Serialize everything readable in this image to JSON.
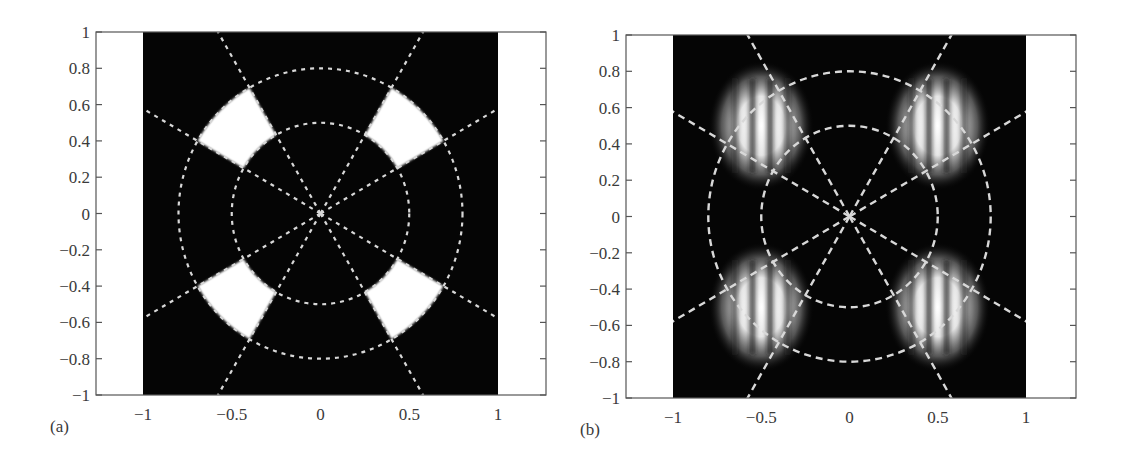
{
  "figure": {
    "panels": [
      {
        "id": "a",
        "label": "(a)"
      },
      {
        "id": "b",
        "label": "(b)"
      }
    ]
  },
  "colors": {
    "background": "#ffffff",
    "plot_field": "#050505",
    "aperture": "#ffffff",
    "overlay_dash": "#d8d8d8",
    "axis": "#555555"
  },
  "chart_data": [
    {
      "type": "heatmap",
      "panel": "(a)",
      "title": "",
      "xlabel": "",
      "ylabel": "",
      "xlim": [
        -1.3,
        1.3
      ],
      "ylim": [
        -1,
        1
      ],
      "image_extent": {
        "x": [
          -1,
          1
        ],
        "y": [
          -1,
          1
        ]
      },
      "x_ticks": [
        -1,
        -0.5,
        0,
        0.5,
        1
      ],
      "x_tick_labels": [
        "−1",
        "−0.5",
        "0",
        "0.5",
        "1"
      ],
      "y_ticks": [
        1,
        0.8,
        0.6,
        0.4,
        0.2,
        0,
        -0.2,
        -0.4,
        -0.6,
        -0.8,
        -1
      ],
      "y_tick_labels": [
        "1",
        "0.8",
        "0.6",
        "0.4",
        "0.2",
        "0",
        "−0.2",
        "−0.4",
        "−0.6",
        "−0.8",
        "−1"
      ],
      "grid": false,
      "description": "Binary aperture mask: four white annular sectors on black",
      "apertures": [
        {
          "r_inner": 0.5,
          "r_outer": 0.8,
          "theta_deg": [
            30,
            60
          ]
        },
        {
          "r_inner": 0.5,
          "r_outer": 0.8,
          "theta_deg": [
            120,
            150
          ]
        },
        {
          "r_inner": 0.5,
          "r_outer": 0.8,
          "theta_deg": [
            210,
            240
          ]
        },
        {
          "r_inner": 0.5,
          "r_outer": 0.8,
          "theta_deg": [
            300,
            330
          ]
        }
      ],
      "overlay": {
        "circles_r": [
          0.5,
          0.8
        ],
        "rays_deg": [
          30,
          60,
          120,
          150,
          210,
          240,
          300,
          330
        ],
        "style": "dashed white"
      }
    },
    {
      "type": "heatmap",
      "panel": "(b)",
      "title": "",
      "xlabel": "",
      "ylabel": "",
      "xlim": [
        -1.3,
        1.3
      ],
      "ylim": [
        -1,
        1
      ],
      "image_extent": {
        "x": [
          -1,
          1
        ],
        "y": [
          -1,
          1
        ]
      },
      "x_ticks": [
        -1,
        -0.5,
        0,
        0.5,
        1
      ],
      "x_tick_labels": [
        "−1",
        "−0.5",
        "0",
        "0.5",
        "1"
      ],
      "y_ticks": [
        1,
        0.8,
        0.6,
        0.4,
        0.2,
        0,
        -0.2,
        -0.4,
        -0.6,
        -0.8,
        -1
      ],
      "y_tick_labels": [
        "1",
        "0.8",
        "0.6",
        "0.4",
        "0.2",
        "0",
        "−0.2",
        "−0.4",
        "−0.6",
        "−0.8",
        "−1"
      ],
      "grid": false,
      "description": "Intensity pattern: four blurred bright lobes with vertical interference fringes at the aperture positions",
      "lobes": [
        {
          "center": [
            -0.5,
            0.5
          ],
          "fringes": "vertical"
        },
        {
          "center": [
            0.5,
            0.5
          ],
          "fringes": "vertical"
        },
        {
          "center": [
            -0.5,
            -0.5
          ],
          "fringes": "vertical"
        },
        {
          "center": [
            0.5,
            -0.5
          ],
          "fringes": "vertical"
        }
      ],
      "overlay": {
        "circles_r": [
          0.5,
          0.8
        ],
        "rays_deg": [
          30,
          60,
          120,
          150,
          210,
          240,
          300,
          330
        ],
        "style": "dashed white"
      }
    }
  ]
}
